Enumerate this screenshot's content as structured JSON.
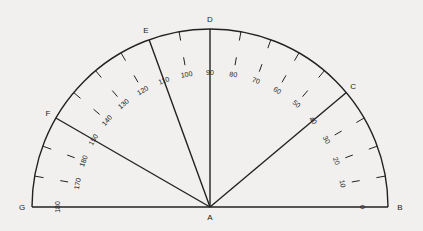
{
  "diagram": {
    "center": {
      "x": 210,
      "y": 207
    },
    "radius": 178,
    "stroke_color": "#222222",
    "background": "#f1f0ee",
    "points": [
      {
        "name": "A",
        "angle": null
      },
      {
        "name": "B",
        "angle": 0
      },
      {
        "name": "C",
        "angle": 40
      },
      {
        "name": "D",
        "angle": 90
      },
      {
        "name": "E",
        "angle": 110
      },
      {
        "name": "F",
        "angle": 150
      },
      {
        "name": "G",
        "angle": 180
      }
    ],
    "rays": [
      "AB",
      "AC",
      "AD",
      "AE",
      "AF",
      "AG"
    ],
    "scale_labels": [
      {
        "text": "0",
        "angle": 0
      },
      {
        "text": "10",
        "angle": 10
      },
      {
        "text": "20",
        "angle": 20
      },
      {
        "text": "30",
        "angle": 30
      },
      {
        "text": "40",
        "angle": 40
      },
      {
        "text": "50",
        "angle": 50
      },
      {
        "text": "60",
        "angle": 60
      },
      {
        "text": "70",
        "angle": 70
      },
      {
        "text": "80",
        "angle": 80
      },
      {
        "text": "90",
        "angle": 90
      },
      {
        "text": "100",
        "angle": 100
      },
      {
        "text": "110",
        "angle": 110
      },
      {
        "text": "120",
        "angle": 120
      },
      {
        "text": "130",
        "angle": 130
      },
      {
        "text": "140",
        "angle": 140
      },
      {
        "text": "150",
        "angle": 150
      },
      {
        "text": "180",
        "angle": 160
      },
      {
        "text": "170",
        "angle": 170
      },
      {
        "text": "180",
        "angle": 180
      }
    ]
  }
}
